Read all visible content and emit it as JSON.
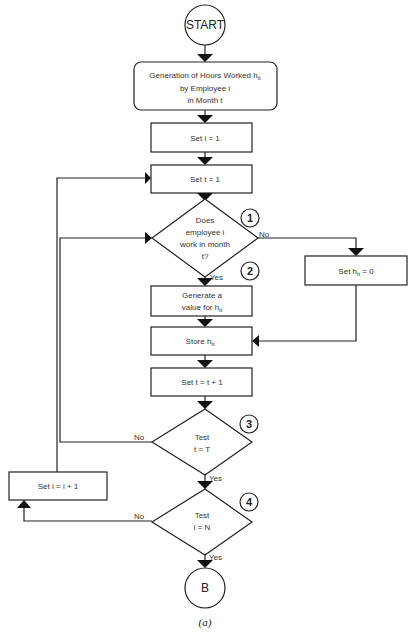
{
  "diagram": {
    "start": "START",
    "generation": {
      "line1": "Generation of Hours Worked h",
      "sub": "it",
      "line2": "by Employee i",
      "line3": "in Month t"
    },
    "set_i": "Set i = 1",
    "set_t": "Set t = 1",
    "decision1": {
      "line1": "Does",
      "line2": "employee i",
      "line3": "work in month",
      "line4": "t?",
      "no": "No",
      "yes": "Yes",
      "step": "1"
    },
    "set_h_zero": {
      "prefix": "Set h",
      "sub": "it",
      "suffix": " = 0"
    },
    "step2": "2",
    "generate": {
      "line1": "Generate a",
      "line2": "value for h",
      "sub": "it"
    },
    "store": {
      "prefix": "Store h",
      "sub": "it"
    },
    "increment_t": "Set t = t + 1",
    "decision3": {
      "line1": "Test",
      "line2": "t = T",
      "no": "No",
      "yes": "Yes",
      "step": "3"
    },
    "increment_i": "Set i = i + 1",
    "decision4": {
      "line1": "Test",
      "line2": "i = N",
      "no": "No",
      "yes": "Yes",
      "step": "4"
    },
    "end": "B",
    "caption": "(a)"
  }
}
